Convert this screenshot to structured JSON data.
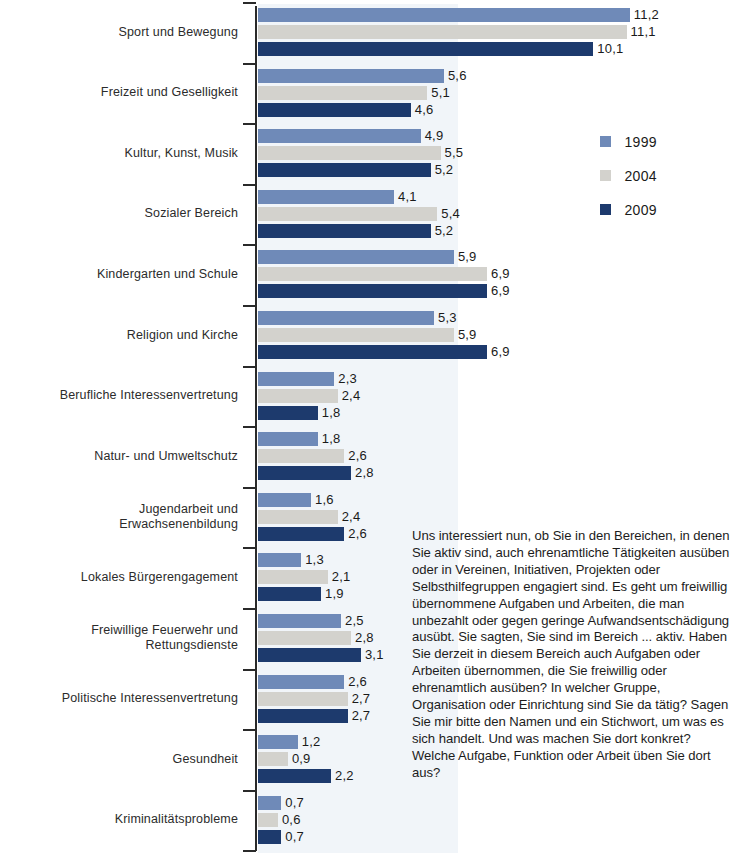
{
  "legend": {
    "position": "right",
    "items": [
      {
        "label": "1999",
        "color": "#6f8ab8"
      },
      {
        "label": "2004",
        "color": "#d3d2cd"
      },
      {
        "label": "2009",
        "color": "#1d3a6d"
      }
    ]
  },
  "side_note": {
    "text": "Uns interessiert nun, ob Sie in den Bereichen, in denen Sie aktiv sind, auch ehrenamtliche Tätigkeiten ausüben oder in Vereinen, Initiativen, Projekten oder Selbsthilfegruppen engagiert sind. Es geht um freiwillig übernommene Aufgaben und Arbeiten, die man unbezahlt oder gegen geringe Aufwandsentschädigung ausübt. Sie sagten, Sie sind im Bereich ... aktiv. Haben Sie derzeit in diesem Bereich auch Aufgaben oder Arbeiten übernommen, die Sie freiwillig oder ehrenamtlich ausüben? In welcher Gruppe, Organisation oder Einrichtung sind Sie da tätig? Sagen Sie mir bitte den Namen und ein Stichwort, um was es sich handelt. Und was machen Sie dort konkret? Welche Aufgabe, Funktion oder Arbeit üben Sie dort aus?"
  },
  "chart_data": {
    "type": "bar",
    "orientation": "horizontal",
    "title": "",
    "xlabel": "",
    "ylabel": "",
    "xlim": [
      0,
      11.2
    ],
    "grid": false,
    "value_labels": true,
    "decimal_separator": ",",
    "categories": [
      "Sport und Bewegung",
      "Freizeit und Geselligkeit",
      "Kultur, Kunst, Musik",
      "Sozialer Bereich",
      "Kindergarten und Schule",
      "Religion und Kirche",
      "Berufliche Interessenvertretung",
      "Natur- und Umweltschutz",
      "Jugendarbeit und Erwachsenenbildung",
      "Lokales Bürgerengagement",
      "Freiwillige Feuerwehr und Rettungsdienste",
      "Politische Interessenvertretung",
      "Gesundheit",
      "Kriminalitätsprobleme"
    ],
    "category_lines": [
      [
        "Sport und Bewegung"
      ],
      [
        "Freizeit und Geselligkeit"
      ],
      [
        "Kultur, Kunst, Musik"
      ],
      [
        "Sozialer Bereich"
      ],
      [
        "Kindergarten und Schule"
      ],
      [
        "Religion und Kirche"
      ],
      [
        "Berufliche Interessenvertretung"
      ],
      [
        "Natur- und Umweltschutz"
      ],
      [
        "Jugendarbeit und",
        "Erwachsenenbildung"
      ],
      [
        "Lokales Bürgerengagement"
      ],
      [
        "Freiwillige Feuerwehr und",
        "Rettungsdienste"
      ],
      [
        "Politische Interessenvertretung"
      ],
      [
        "Gesundheit"
      ],
      [
        "Kriminalitätsprobleme"
      ]
    ],
    "series": [
      {
        "name": "1999",
        "color": "#6f8ab8",
        "values": [
          11.2,
          5.6,
          4.9,
          4.1,
          5.9,
          5.3,
          2.3,
          1.8,
          1.6,
          1.3,
          2.5,
          2.6,
          1.2,
          0.7
        ],
        "labels": [
          "11,2",
          "5,6",
          "4,9",
          "4,1",
          "5,9",
          "5,3",
          "2,3",
          "1,8",
          "1,6",
          "1,3",
          "2,5",
          "2,6",
          "1,2",
          "0,7"
        ]
      },
      {
        "name": "2004",
        "color": "#d3d2cd",
        "values": [
          11.1,
          5.1,
          5.5,
          5.4,
          6.9,
          5.9,
          2.4,
          2.6,
          2.4,
          2.1,
          2.8,
          2.7,
          0.9,
          0.6
        ],
        "labels": [
          "11,1",
          "5,1",
          "5,5",
          "5,4",
          "6,9",
          "5,9",
          "2,4",
          "2,6",
          "2,4",
          "2,1",
          "2,8",
          "2,7",
          "0,9",
          "0,6"
        ]
      },
      {
        "name": "2009",
        "color": "#1d3a6d",
        "values": [
          10.1,
          4.6,
          5.2,
          5.2,
          6.9,
          6.9,
          1.8,
          2.8,
          2.6,
          1.9,
          3.1,
          2.7,
          2.2,
          0.7
        ],
        "labels": [
          "10,1",
          "4,6",
          "5,2",
          "5,2",
          "6,9",
          "6,9",
          "1,8",
          "2,8",
          "2,6",
          "1,9",
          "3,1",
          "2,7",
          "2,2",
          "0,7"
        ]
      }
    ]
  }
}
